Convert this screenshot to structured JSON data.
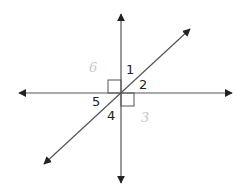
{
  "diagram": {
    "type": "intersecting-lines",
    "colors": {
      "line": "#555555",
      "arrow": "#222222",
      "label": "#222222",
      "faint_label": "#c8c8c8"
    },
    "intersection": [
      121,
      93
    ],
    "lines": [
      {
        "name": "vertical-line",
        "from": [
          121,
          183
        ],
        "to": [
          121,
          14
        ]
      },
      {
        "name": "horizontal-line",
        "from": [
          19,
          93
        ],
        "to": [
          232,
          93
        ]
      },
      {
        "name": "diagonal-line",
        "from": [
          44,
          164
        ],
        "to": [
          190,
          29
        ]
      }
    ],
    "right_angle_marks": [
      {
        "name": "right-angle-upper-left",
        "x": 108,
        "y": 80,
        "size": 13
      },
      {
        "name": "right-angle-lower-right",
        "x": 121,
        "y": 93,
        "size": 13
      }
    ],
    "angle_labels": [
      {
        "name": "angle-label-1",
        "text": "1",
        "x": 126,
        "y": 74,
        "faint": false
      },
      {
        "name": "angle-label-2",
        "text": "2",
        "x": 139,
        "y": 89,
        "faint": false
      },
      {
        "name": "angle-label-3",
        "text": "3",
        "x": 141,
        "y": 122,
        "faint": true
      },
      {
        "name": "angle-label-4",
        "text": "4",
        "x": 107,
        "y": 120,
        "faint": false
      },
      {
        "name": "angle-label-5",
        "text": "5",
        "x": 92,
        "y": 106,
        "faint": false
      },
      {
        "name": "angle-label-6",
        "text": "6",
        "x": 89,
        "y": 72,
        "faint": true
      }
    ]
  }
}
